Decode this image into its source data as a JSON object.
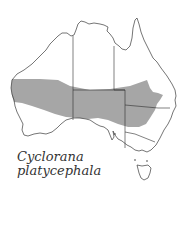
{
  "map": {
    "region": "Australia",
    "species_label": {
      "line1": "Cyclorana",
      "line2": "platycephala"
    },
    "colors": {
      "range_fill": "#a6a6a6",
      "outline": "#3a3a3a",
      "background": "#ffffff"
    },
    "layers": [
      "coastline",
      "state-borders",
      "species-range",
      "tasmania"
    ]
  }
}
